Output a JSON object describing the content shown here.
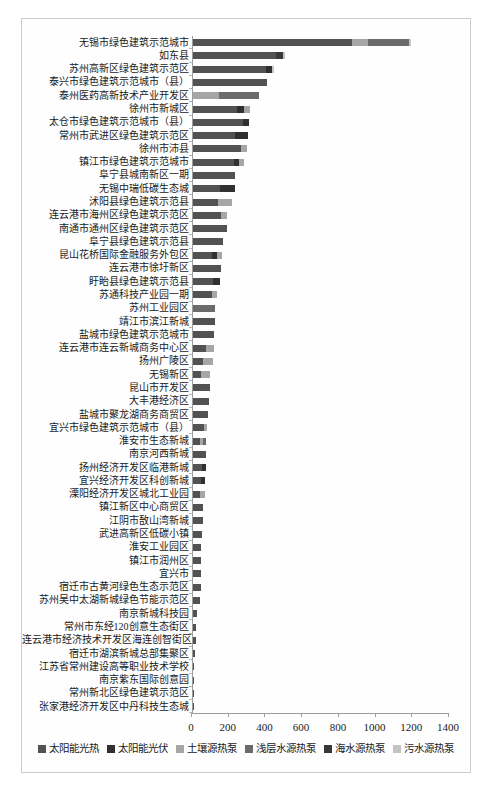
{
  "chart_data": {
    "type": "bar",
    "orientation": "horizontal",
    "stacked": true,
    "title": "",
    "xlabel": "",
    "ylabel": "",
    "xlim": [
      0,
      1400
    ],
    "x_ticks": [
      0,
      200,
      400,
      600,
      800,
      1000,
      1200,
      1400
    ],
    "grid": false,
    "legend_position": "bottom",
    "frame_border_color": "#cccccc",
    "axis_color": "#9c9c9c",
    "categories": [
      "无锡市绿色建筑示范城市",
      "如东县",
      "苏州高新区绿色建筑示范区",
      "泰兴市绿色建筑示范城市（县）",
      "泰州医药高新技术产业开发区",
      "徐州市新城区",
      "太仓市绿色建筑示范城市（县）",
      "常州市武进区绿色建筑示范区",
      "徐州市沛县",
      "镇江市绿色建筑示范城市",
      "阜宁县城南新区一期",
      "无锡中瑞低碳生态城",
      "沭阳县绿色建筑示范县",
      "连云港市海州区绿色建筑示范区",
      "南通市通州区绿色建筑示范区",
      "阜宁县绿色建筑示范县",
      "昆山花桥国际金融服务外包区",
      "连云港市徐圩新区",
      "盱眙县绿色建筑示范县",
      "苏通科技产业园一期",
      "苏州工业园区",
      "靖江市滨江新城",
      "盐城市绿色建筑示范城市",
      "连云港市连云新城商务中心区",
      "扬州广陵区",
      "无锡新区",
      "昆山市开发区",
      "大丰港经济区",
      "盐城市聚龙湖商务商贸区",
      "宜兴市绿色建筑示范城市（县）",
      "淮安市生态新城",
      "南京河西新城",
      "扬州经济开发区临港新城",
      "宜兴经济开发区科创新城",
      "溧阳经济开发区城北工业园",
      "镇江新区中心商贸区",
      "江阴市敔山湾新城",
      "武进高新区低碳小镇",
      "淮安工业园区",
      "镇江市润州区",
      "宜兴市",
      "宿迁市古黄河绿色生态示范区",
      "苏州吴中太湖新城绿色节能示范区",
      "南京新城科技园",
      "常州市东经120创意生态街区",
      "连云港市经济技术开发区海连创智街区",
      "宿迁市湖滨新城总部集聚区",
      "江苏省常州建设高等职业技术学校",
      "南京紫东国际创意园",
      "常州新北区绿色建筑示范区",
      "张家港经济开发区中丹科技生态城"
    ],
    "series": [
      {
        "name": "太阳能光热",
        "key": "solar-thermal",
        "color": "#525252",
        "values": [
          870,
          455,
          400,
          407,
          0,
          240,
          275,
          230,
          265,
          225,
          233,
          148,
          136,
          153,
          185,
          167,
          104,
          154,
          113,
          108,
          0,
          120,
          118,
          74,
          56,
          48,
          93,
          90,
          85,
          60,
          40,
          73,
          50,
          48,
          40,
          58,
          55,
          51,
          48,
          45,
          44,
          43,
          40,
          25,
          20,
          18,
          13,
          10,
          9,
          6,
          5
        ]
      },
      {
        "name": "太阳能光伏",
        "key": "solar-pv",
        "color": "#303030",
        "values": [
          0,
          0,
          30,
          0,
          0,
          40,
          30,
          70,
          0,
          30,
          0,
          82,
          0,
          0,
          0,
          0,
          30,
          0,
          35,
          0,
          0,
          0,
          0,
          0,
          0,
          0,
          0,
          0,
          0,
          0,
          0,
          0,
          22,
          22,
          0,
          0,
          0,
          0,
          0,
          0,
          0,
          0,
          0,
          0,
          0,
          0,
          0,
          0,
          0,
          0,
          0
        ]
      },
      {
        "name": "土壤源热泵",
        "key": "ground-source-heat-pump",
        "color": "#a6a6a6",
        "values": [
          85,
          0,
          0,
          0,
          143,
          35,
          0,
          0,
          30,
          25,
          0,
          0,
          78,
          34,
          0,
          0,
          24,
          0,
          0,
          27,
          0,
          0,
          0,
          40,
          54,
          48,
          0,
          0,
          0,
          18,
          16,
          0,
          0,
          0,
          27,
          0,
          0,
          0,
          0,
          0,
          0,
          0,
          0,
          0,
          0,
          0,
          0,
          0,
          0,
          0,
          0
        ]
      },
      {
        "name": "浅层水源热泵",
        "key": "shallow-water-source-heat-pump",
        "color": "#6b6b6b",
        "values": [
          225,
          0,
          0,
          0,
          219,
          0,
          0,
          0,
          0,
          0,
          0,
          0,
          0,
          0,
          0,
          0,
          0,
          0,
          0,
          0,
          122,
          0,
          0,
          0,
          0,
          0,
          0,
          0,
          0,
          0,
          20,
          0,
          0,
          0,
          0,
          0,
          0,
          0,
          0,
          0,
          0,
          0,
          0,
          0,
          0,
          0,
          0,
          0,
          0,
          0,
          0
        ]
      },
      {
        "name": "海水源热泵",
        "key": "seawater-source-heat-pump",
        "color": "#383838",
        "values": [
          0,
          35,
          0,
          0,
          0,
          0,
          0,
          0,
          0,
          0,
          0,
          0,
          0,
          0,
          0,
          0,
          0,
          0,
          0,
          0,
          0,
          0,
          0,
          0,
          0,
          0,
          0,
          0,
          0,
          0,
          0,
          0,
          0,
          0,
          0,
          0,
          0,
          0,
          0,
          0,
          0,
          0,
          0,
          0,
          0,
          0,
          0,
          0,
          0,
          0,
          0
        ]
      },
      {
        "name": "污水源热泵",
        "key": "sewage-source-heat-pump",
        "color": "#c4c4c4",
        "values": [
          10,
          15,
          13,
          0,
          0,
          0,
          0,
          0,
          0,
          0,
          0,
          0,
          0,
          0,
          0,
          0,
          0,
          0,
          0,
          0,
          0,
          0,
          0,
          0,
          0,
          0,
          0,
          0,
          0,
          0,
          0,
          0,
          0,
          0,
          0,
          0,
          0,
          0,
          0,
          0,
          0,
          0,
          0,
          0,
          0,
          0,
          0,
          0,
          0,
          0,
          0
        ]
      }
    ]
  }
}
